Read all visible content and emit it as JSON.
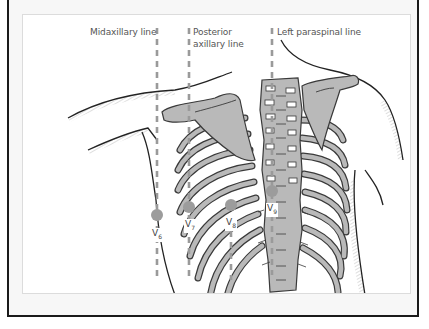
{
  "figure": {
    "type": "anatomical-diagram",
    "colors": {
      "bone_fill": "#b9b9b9",
      "bone_outline": "#3a3a3a",
      "dashed_line": "#9a9a9a",
      "electrode": "#9c9c9c",
      "frame_border": "#1a1a1a",
      "panel_border": "#dcdcdc"
    }
  },
  "reference_lines": [
    {
      "id": "midaxillary",
      "label": "Midaxillary line",
      "x": 157
    },
    {
      "id": "posterior-axillary",
      "label_line1": "Posterior",
      "label_line2": "axillary line",
      "x": 189
    },
    {
      "id": "scapular",
      "label": "",
      "x": 231
    },
    {
      "id": "left-paraspinal",
      "label": "Left paraspinal line",
      "x": 272
    }
  ],
  "labels": {
    "midaxillary": "Midaxillary line",
    "posterior_axillary_1": "Posterior",
    "posterior_axillary_2": "axillary line",
    "left_paraspinal": "Left paraspinal line"
  },
  "electrodes": [
    {
      "lead": "V",
      "sub": "6",
      "x": 157,
      "y": 215
    },
    {
      "lead": "V",
      "sub": "7",
      "x": 189,
      "y": 207
    },
    {
      "lead": "V",
      "sub": "8",
      "x": 231,
      "y": 205
    },
    {
      "lead": "V",
      "sub": "9",
      "x": 272,
      "y": 191
    }
  ]
}
